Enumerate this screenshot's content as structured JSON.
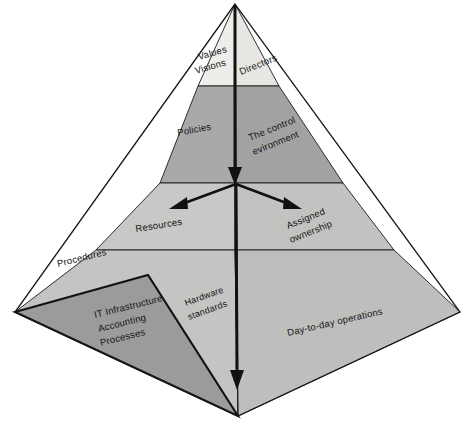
{
  "diagram": {
    "type": "3d-pyramid",
    "colors": {
      "apex_band": "#ededea",
      "second_band_left": "#a9a9a9",
      "second_band_right": "#a2a2a2",
      "third_band_left": "#c8c8c6",
      "third_band_right": "#c2c2c0",
      "base_band_left": "#c4c4c2",
      "base_band_right": "#bebebc",
      "inner_triangle": "#9b9b9b",
      "outline": "#1a1a1a",
      "arrow": "#111111",
      "background": "#ffffff"
    },
    "bands": [
      {
        "level": 1,
        "name": "apex",
        "left_label": "Values\nVisions",
        "right_label": "Directors"
      },
      {
        "level": 2,
        "name": "policies",
        "left_label": "Policies",
        "right_label": "The control\nevironment"
      },
      {
        "level": 3,
        "name": "resources",
        "left_label": "Resources",
        "right_label": "Assigned\nownership"
      },
      {
        "level": 4,
        "name": "base",
        "left_label": "Procedures",
        "mid_label": "Hardware\nstandards",
        "right_label": "Day-to-day operations"
      }
    ],
    "labels": {
      "values": "Values",
      "visions": "Visions",
      "directors": "Directors",
      "policies": "Policies",
      "control_environment_line1": "The control",
      "control_environment_line2": "evironment",
      "resources": "Resources",
      "assigned_line1": "Assigned",
      "assigned_line2": "ownership",
      "procedures": "Procedures",
      "hardware_line1": "Hardware",
      "hardware_line2": "standards",
      "day_to_day": "Day-to-day operations",
      "it_infrastructure": "IT Infrastructure",
      "accounting": "Accounting",
      "processes": "Processes"
    },
    "arrows": [
      {
        "name": "vertical-axis-arrow",
        "direction": "down",
        "from": "apex",
        "to": "base"
      },
      {
        "name": "left-branch-arrow",
        "direction": "down-left",
        "from": "center"
      },
      {
        "name": "right-branch-arrow",
        "direction": "down-right",
        "from": "center"
      }
    ]
  }
}
